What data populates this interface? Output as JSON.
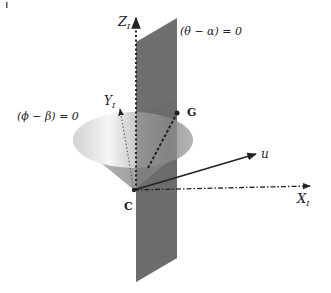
{
  "diagram": {
    "type": "3d-geometry",
    "axes": {
      "z": {
        "label": "Z",
        "subscript": "I",
        "style": "dotted"
      },
      "y": {
        "label": "Y",
        "subscript": "I",
        "style": "dotted"
      },
      "x": {
        "label": "X",
        "subscript": "I",
        "style": "dash-dot"
      }
    },
    "vectors": {
      "u": {
        "label": "u",
        "style": "solid"
      }
    },
    "points": {
      "origin": {
        "label": "C"
      },
      "g": {
        "label": "G"
      }
    },
    "surfaces": {
      "plane": {
        "label": "(θ − α) = 0",
        "color": "#6e6e6e"
      },
      "cone": {
        "label": "(ϕ − β) = 0",
        "color": "#a8a8a8"
      }
    },
    "colors": {
      "plane": "#6b6b6b",
      "cone_light": "#f4f4f4",
      "cone_dark": "#9a9a9a",
      "axis": "#222222"
    }
  }
}
